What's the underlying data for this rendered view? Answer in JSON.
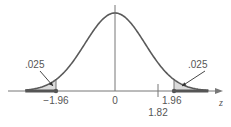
{
  "chart_data": {
    "type": "area",
    "title": "",
    "distribution": "standard normal",
    "xlabel": "z",
    "xlim": [
      -3.0,
      3.0
    ],
    "ticks": [
      {
        "value": -1.96,
        "label": "−1.96"
      },
      {
        "value": 0,
        "label": "0"
      },
      {
        "value": 1.96,
        "label": "1.96"
      }
    ],
    "marker": {
      "value": 1.82,
      "label": "1.82"
    },
    "shaded_regions": [
      {
        "side": "left",
        "from": -3.0,
        "to": -1.96,
        "area_label": ".025"
      },
      {
        "side": "right",
        "from": 1.96,
        "to": 3.0,
        "area_label": ".025"
      }
    ],
    "colors": {
      "curve": "#5a5a5a",
      "shade": "#dcdcdc",
      "rejection_bar": "#555555",
      "axis": "#777777"
    }
  }
}
